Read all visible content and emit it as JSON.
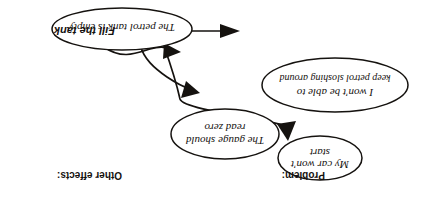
{
  "diagram": {
    "type": "cause-effect-sketch",
    "orientation": "rotated-180",
    "title_labels": {
      "problem": "Problem:",
      "other_effects": "Other effects:"
    },
    "nodes": [
      {
        "id": "cause",
        "role": "root-cause",
        "lines": [
          "The petrol tank is empty"
        ]
      },
      {
        "id": "effect-start",
        "role": "problem-effect",
        "lines": [
          "My car won't",
          "start"
        ]
      },
      {
        "id": "effect-gauge",
        "role": "other-effect",
        "lines": [
          "The gauge should",
          "read zero"
        ]
      },
      {
        "id": "effect-slosh",
        "role": "other-effect",
        "lines": [
          "I won't be able to",
          "keep petrol sloshing around"
        ]
      }
    ],
    "edges": [
      {
        "id": "edge-fill",
        "from": "action",
        "to": "cause",
        "label": "Fill the tank",
        "style": "straight"
      },
      {
        "id": "edge-cause-slosh",
        "from": "cause",
        "to": "effect-slosh",
        "label": "",
        "style": "curved"
      },
      {
        "id": "edge-cause-gauge",
        "from": "cause",
        "to": "effect-gauge",
        "label": "",
        "style": "curved"
      },
      {
        "id": "edge-cause-start",
        "from": "cause",
        "to": "effect-start",
        "label": "",
        "style": "curved"
      }
    ],
    "colors": {
      "ink": "#15120f",
      "paper": "#ffffff"
    }
  }
}
